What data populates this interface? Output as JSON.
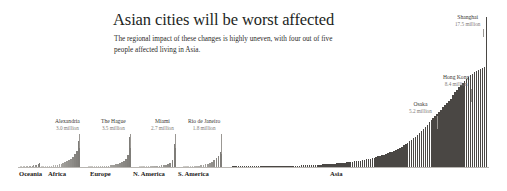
{
  "header": {
    "title": "Asian cities will be worst affected",
    "subtitle": "The regional impact of these changes is highly uneven, with four out of five people affected living in Asia."
  },
  "colors": {
    "background": "#ffffff",
    "title_text": "#231f1d",
    "subtitle_text": "#2c2a28",
    "bar_light": "#cfcdc9",
    "bar_dark": "#4a4744",
    "baseline": "#b9b6b2",
    "leader_line": "#9b9894",
    "callout_name": "#3a3734",
    "callout_value": "#7d7a76"
  },
  "chart_data": {
    "type": "bar",
    "title": "Asian cities will be worst affected",
    "subtitle": "The regional impact of these changes is highly uneven, with four out of five people affected living in Asia.",
    "xlabel": "",
    "ylabel": "",
    "unit": "millions of people affected",
    "grid": false,
    "legend": "none",
    "ylim": [
      0,
      17.5
    ],
    "regions": [
      {
        "name": "Oceania",
        "label": "Oceania",
        "bar_count": 14,
        "values": [
          0.02,
          0.03,
          0.04,
          0.05,
          0.06,
          0.08,
          0.1,
          0.12,
          0.15,
          0.18,
          0.22,
          0.28,
          0.34,
          0.42
        ]
      },
      {
        "name": "Africa",
        "label": "Africa",
        "bar_count": 20,
        "values": [
          0.05,
          0.07,
          0.09,
          0.11,
          0.14,
          0.17,
          0.2,
          0.24,
          0.28,
          0.33,
          0.39,
          0.46,
          0.55,
          0.66,
          0.8,
          0.98,
          1.2,
          1.5,
          1.9,
          3.0
        ],
        "peak_city": "Alexandria",
        "peak_value": 3.0
      },
      {
        "name": "Europe",
        "label": "Europe",
        "bar_count": 22,
        "values": [
          0.02,
          0.03,
          0.04,
          0.05,
          0.06,
          0.07,
          0.09,
          0.1,
          0.12,
          0.14,
          0.16,
          0.19,
          0.22,
          0.26,
          0.31,
          0.37,
          0.45,
          0.56,
          0.72,
          0.95,
          1.4,
          3.5
        ],
        "peak_city": "The Hague",
        "peak_value": 3.5
      },
      {
        "name": "N. America",
        "label": "N. America",
        "bar_count": 17,
        "values": [
          0.02,
          0.03,
          0.04,
          0.05,
          0.06,
          0.08,
          0.09,
          0.11,
          0.13,
          0.16,
          0.19,
          0.23,
          0.29,
          0.38,
          0.52,
          0.85,
          2.7
        ],
        "peak_city": "Miami",
        "peak_value": 2.7
      },
      {
        "name": "S. America",
        "label": "S. America",
        "bar_count": 18,
        "values": [
          0.03,
          0.04,
          0.05,
          0.07,
          0.09,
          0.11,
          0.14,
          0.17,
          0.21,
          0.26,
          0.32,
          0.4,
          0.5,
          0.62,
          0.78,
          1.0,
          1.3,
          1.8
        ],
        "peak_city": "Rio de Janeiro",
        "peak_value": 1.8
      },
      {
        "name": "Asia",
        "label": "Asia",
        "bar_count": 130,
        "peak_city": "Shanghai",
        "peak_value": 17.5,
        "values": [
          0.02,
          0.02,
          0.03,
          0.03,
          0.03,
          0.04,
          0.04,
          0.04,
          0.05,
          0.05,
          0.05,
          0.06,
          0.06,
          0.06,
          0.07,
          0.07,
          0.08,
          0.08,
          0.08,
          0.09,
          0.09,
          0.1,
          0.1,
          0.11,
          0.11,
          0.12,
          0.12,
          0.13,
          0.13,
          0.14,
          0.15,
          0.15,
          0.16,
          0.17,
          0.17,
          0.18,
          0.19,
          0.2,
          0.21,
          0.22,
          0.23,
          0.24,
          0.25,
          0.26,
          0.27,
          0.28,
          0.3,
          0.31,
          0.33,
          0.34,
          0.36,
          0.38,
          0.4,
          0.42,
          0.44,
          0.46,
          0.48,
          0.51,
          0.53,
          0.56,
          0.59,
          0.62,
          0.65,
          0.69,
          0.72,
          0.76,
          0.8,
          0.85,
          0.89,
          0.94,
          0.99,
          1.05,
          1.1,
          1.16,
          1.23,
          1.3,
          1.37,
          1.45,
          1.53,
          1.62,
          1.71,
          1.81,
          1.91,
          2.02,
          2.14,
          2.26,
          2.39,
          2.53,
          2.67,
          2.83,
          2.99,
          3.16,
          3.34,
          3.53,
          3.73,
          3.94,
          4.16,
          4.4,
          4.64,
          4.9,
          5.2,
          5.45,
          5.7,
          5.95,
          6.2,
          6.45,
          6.7,
          6.95,
          7.2,
          7.45,
          7.7,
          7.95,
          8.4,
          8.7,
          9.0,
          9.3,
          9.55,
          9.8,
          10.05,
          10.3,
          10.5,
          10.7,
          10.9,
          11.05,
          11.2,
          11.35,
          11.45,
          11.55,
          11.65,
          17.5
        ]
      }
    ],
    "annotations": [
      {
        "city": "Alexandria",
        "value_label": "3.0 million",
        "value": 3.0,
        "region": "Africa"
      },
      {
        "city": "The Hague",
        "value_label": "3.5 million",
        "value": 3.5,
        "region": "Europe"
      },
      {
        "city": "Miami",
        "value_label": "2.7 million",
        "value": 2.7,
        "region": "N. America"
      },
      {
        "city": "Rio de Janeiro",
        "value_label": "1.8 million",
        "value": 1.8,
        "region": "S. America"
      },
      {
        "city": "Osaka",
        "value_label": "5.2 million",
        "value": 5.2,
        "region": "Asia"
      },
      {
        "city": "Hong Kong",
        "value_label": "8.4 million",
        "value": 8.4,
        "region": "Asia"
      },
      {
        "city": "Shanghai",
        "value_label": "17.5 million",
        "value": 17.5,
        "region": "Asia"
      }
    ]
  }
}
